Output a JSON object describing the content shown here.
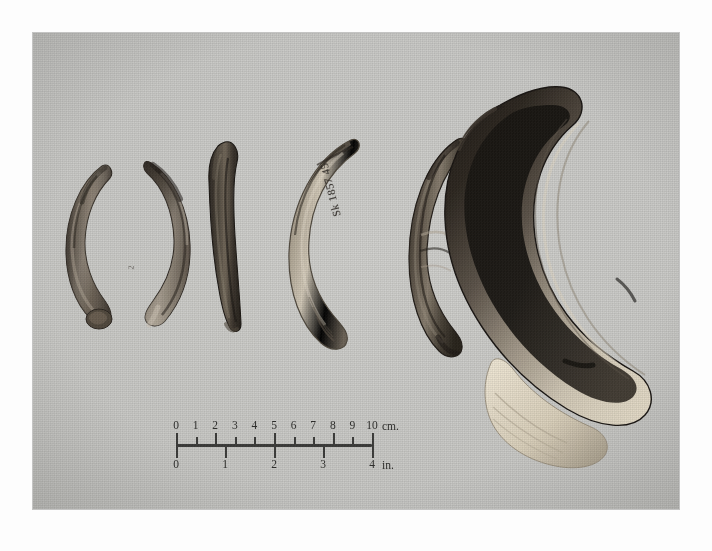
{
  "image": {
    "kind": "archival-photograph",
    "subject": "six fossil tusks arranged left to right by increasing size on a cloth background",
    "background_color": "#c6c6c3",
    "print_border_color": "#fdfdfd"
  },
  "scale_bar": {
    "cm": {
      "unit_label": "cm.",
      "ticks": [
        "0",
        "1",
        "2",
        "3",
        "4",
        "5",
        "6",
        "7",
        "8",
        "9",
        "10"
      ],
      "major_every": 1,
      "length_px": 196
    },
    "in": {
      "unit_label": "in.",
      "ticks": [
        "0",
        "1",
        "2",
        "3",
        "4"
      ],
      "length_px": 196
    }
  },
  "annotations": {
    "catalog_number": "Sk 1857 45",
    "small_mark": "2"
  },
  "specimens": [
    {
      "id": "specimen-1",
      "position": "leftmost",
      "form": "crescent",
      "curvature": "concave-right",
      "tone": "mottled dark brown with pale worn band",
      "relative_size": "smallest"
    },
    {
      "id": "specimen-2",
      "position": "second",
      "form": "crescent",
      "curvature": "concave-left",
      "tone": "dark brown with pale lower third",
      "relative_size": "small"
    },
    {
      "id": "specimen-3",
      "position": "third",
      "form": "nearly straight blade",
      "curvature": "slight",
      "tone": "very dark, near black",
      "relative_size": "small-medium"
    },
    {
      "id": "specimen-4",
      "position": "fourth",
      "form": "broad crescent",
      "curvature": "concave-right",
      "tone": "pale cream with dark tip, bears ink catalog number",
      "relative_size": "medium"
    },
    {
      "id": "specimen-5",
      "position": "fifth",
      "form": "crescent",
      "curvature": "concave-right",
      "tone": "dark brown, heavily textured",
      "relative_size": "medium"
    },
    {
      "id": "specimen-6",
      "position": "rightmost",
      "form": "deep hook / near half-circle",
      "curvature": "strong concave-left",
      "tone": "black enamel band over pale cream dentine base",
      "relative_size": "largest"
    }
  ]
}
